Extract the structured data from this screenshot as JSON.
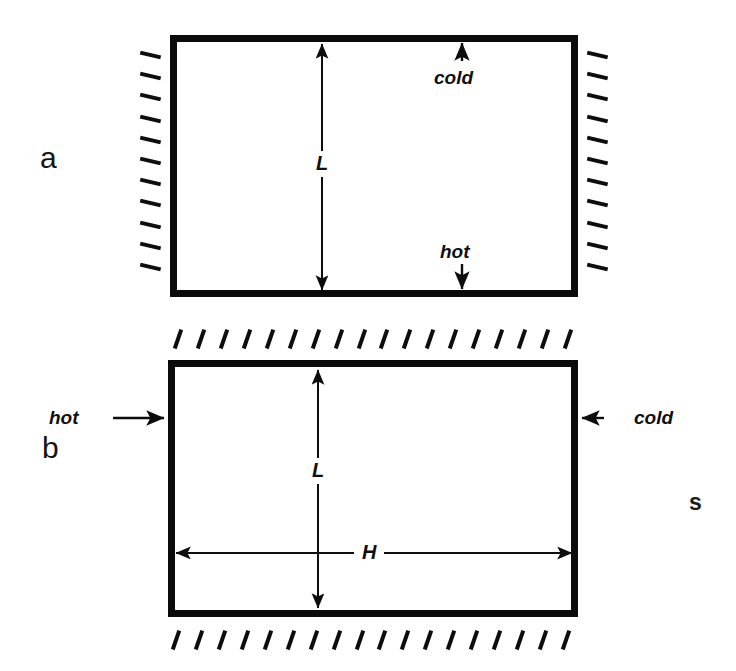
{
  "figure": {
    "kind": "thermal-convection-enclosure-schematic",
    "background_color": "#ffffff",
    "line_color": "#0b0b0b",
    "panels": [
      {
        "id": "a",
        "letter": "a",
        "orientation": "heated-from-below",
        "box": {
          "x": 170,
          "y": 35,
          "width": 408,
          "height": 262,
          "border_px": 7
        },
        "insulated_walls": [
          "left",
          "right"
        ],
        "hatch": {
          "style": "shallow-dash",
          "left_count": 11,
          "right_count": 11,
          "angle_deg": 13
        },
        "thermal_labels": [
          {
            "name": "cold",
            "text": "cold",
            "wall": "top",
            "arrow": "up",
            "x": 462,
            "y": 78
          },
          {
            "name": "hot",
            "text": "hot",
            "wall": "bottom",
            "arrow": "down",
            "x": 462,
            "y": 252
          }
        ],
        "dimensions": [
          {
            "symbol": "L",
            "axis": "vertical",
            "x": 322,
            "from_y": 44,
            "to_y": 290,
            "label_y": 163
          }
        ]
      },
      {
        "id": "b",
        "letter": "b",
        "orientation": "heated-from-the-side",
        "box": {
          "x": 168,
          "y": 360,
          "width": 410,
          "height": 257,
          "border_px": 7
        },
        "insulated_walls": [
          "top",
          "bottom"
        ],
        "hatch": {
          "style": "steep-slash",
          "top_count": 18,
          "bottom_count": 18,
          "angle_deg": 19
        },
        "thermal_labels": [
          {
            "name": "hot",
            "text": "hot",
            "wall": "left",
            "arrow": "right",
            "x": 95,
            "y": 418
          },
          {
            "name": "cold",
            "text": "cold",
            "wall": "right",
            "arrow": "left",
            "x": 620,
            "y": 418
          }
        ],
        "dimensions": [
          {
            "symbol": "L",
            "axis": "vertical",
            "x": 318,
            "from_y": 370,
            "to_y": 608,
            "label_y": 470
          },
          {
            "symbol": "H",
            "axis": "horizontal",
            "y": 553,
            "from_x": 176,
            "to_x": 572,
            "label_x": 368
          }
        ]
      }
    ],
    "margin_glyph": {
      "text": "s",
      "x": 689,
      "y": 491
    }
  }
}
